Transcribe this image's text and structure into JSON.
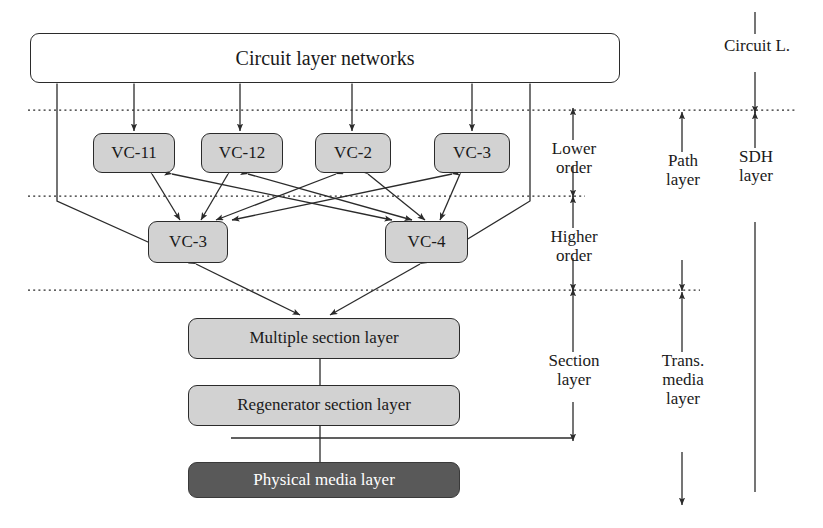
{
  "figure": {
    "colors": {
      "node_gray": "#d2d2d2",
      "node_dark": "#595959",
      "node_white": "#ffffff",
      "stroke": "#2b2b2b",
      "text": "#1a1a1a",
      "text_inverse": "#ffffff"
    }
  },
  "nodes": {
    "circuit_layer": {
      "label": "Circuit layer networks"
    },
    "lower_order": [
      {
        "label": "VC-11"
      },
      {
        "label": "VC-12"
      },
      {
        "label": "VC-2"
      },
      {
        "label": "VC-3"
      }
    ],
    "higher_order": [
      {
        "label": "VC-3"
      },
      {
        "label": "VC-4"
      }
    ],
    "multiple_section": {
      "label": "Multiple section layer"
    },
    "regenerator_section": {
      "label": "Regenerator section layer"
    },
    "physical_media": {
      "label": "Physical media layer"
    }
  },
  "annotations": {
    "lower_order": "Lower\norder",
    "higher_order": "Higher\norder",
    "section_layer": "Section\nlayer",
    "path_layer": "Path\nlayer",
    "trans_media_layer": "Trans.\nmedia\nlayer",
    "circuit_l": "Circuit L.",
    "sdh_layer": "SDH\nlayer"
  }
}
